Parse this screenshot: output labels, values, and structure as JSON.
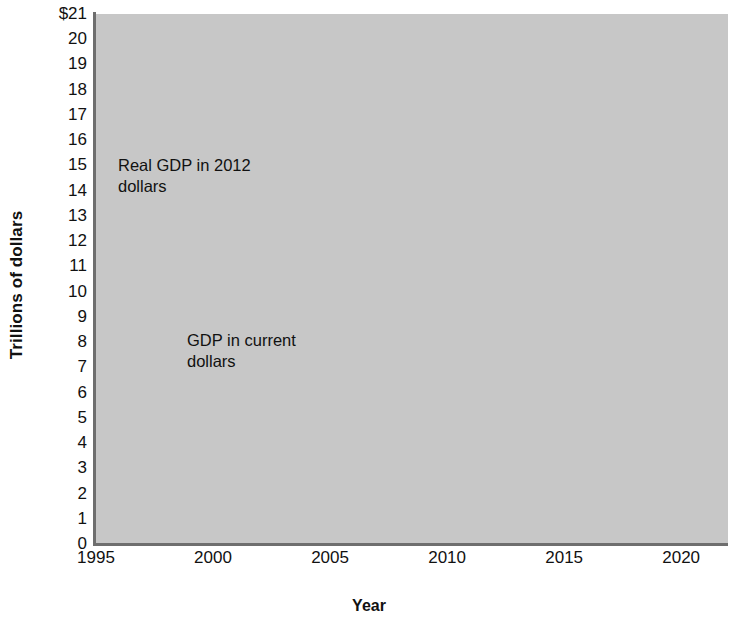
{
  "chart_data": {
    "type": "line",
    "title": "",
    "xlabel": "Year",
    "ylabel": "Trillions of dollars",
    "xlim": [
      1995,
      2022
    ],
    "ylim": [
      0,
      21
    ],
    "grid": true,
    "legend_position": "inline-annotations",
    "x_ticks": [
      "1995",
      "2000",
      "2005",
      "2010",
      "2015",
      "2020"
    ],
    "x_tick_values": [
      1995,
      2000,
      2005,
      2010,
      2015,
      2020
    ],
    "y_ticks": [
      "0",
      "1",
      "2",
      "3",
      "4",
      "5",
      "6",
      "7",
      "8",
      "9",
      "10",
      "11",
      "12",
      "13",
      "14",
      "15",
      "16",
      "17",
      "18",
      "19",
      "20",
      "$21"
    ],
    "y_tick_values": [
      0,
      1,
      2,
      3,
      4,
      5,
      6,
      7,
      8,
      9,
      10,
      11,
      12,
      13,
      14,
      15,
      16,
      17,
      18,
      19,
      20,
      21
    ],
    "series": [
      {
        "name": "Real GDP in 2012 dollars",
        "color": "#5a5a5a",
        "x": [
          1995,
          2000,
          2005,
          2008,
          2010,
          2013,
          2015,
          2020
        ],
        "values": [
          10.8,
          13.1,
          15.1,
          15.6,
          15.8,
          16.8,
          17.4,
          18.8
        ]
      },
      {
        "name": "GDP in current dollars",
        "color": "#5a5a5a",
        "x": [
          1995,
          2000,
          2005,
          2008,
          2010,
          2013,
          2015,
          2020
        ],
        "values": [
          7.8,
          10.3,
          13.1,
          14.8,
          15.0,
          16.8,
          18.2,
          20.7
        ]
      }
    ],
    "annotations": [
      {
        "text": "Real GDP in 2012\ndollars",
        "points_to_series": "Real GDP in 2012 dollars",
        "points_to_x": 2003
      },
      {
        "text": "GDP in current\ndollars",
        "points_to_series": "GDP in current dollars",
        "points_to_x": 2000
      }
    ],
    "colors": {
      "plot_background": "#c7c7c7",
      "gridline": "#ffffff",
      "axis": "#6e6e6e",
      "line": "#5a5a5a",
      "text": "#111111"
    }
  }
}
